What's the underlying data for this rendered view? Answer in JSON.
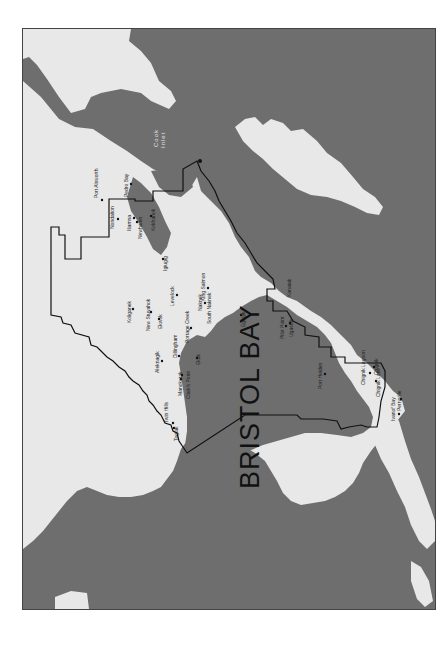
{
  "map": {
    "region_title": "BRISTOL BAY",
    "water_label_line1": "Cook",
    "water_label_line2": "Inlet",
    "orientation": "rotated 90° counter-clockwise",
    "colors": {
      "water": "#6e6e6e",
      "land": "#e8e8e8",
      "boundary": "#111111",
      "frame": "#444444"
    },
    "places": [
      {
        "name": "Port Alsworth"
      },
      {
        "name": "Nondalton"
      },
      {
        "name": "Pedro Bay"
      },
      {
        "name": "Iliamna"
      },
      {
        "name": "Newhalen"
      },
      {
        "name": "Kokhanok"
      },
      {
        "name": "Igiugig"
      },
      {
        "name": "Koliganek"
      },
      {
        "name": "New Stuyahok"
      },
      {
        "name": "Ekwok"
      },
      {
        "name": "Levelock"
      },
      {
        "name": "King Salmon"
      },
      {
        "name": "Naknek"
      },
      {
        "name": "South Naknek"
      },
      {
        "name": "Portage Creek"
      },
      {
        "name": "Dillingham"
      },
      {
        "name": "Aleknagik"
      },
      {
        "name": "Ekuk"
      },
      {
        "name": "Clark's Point"
      },
      {
        "name": "Manokotak"
      },
      {
        "name": "Twin Hills"
      },
      {
        "name": "Togiak"
      },
      {
        "name": "Egegik"
      },
      {
        "name": "Pilot Point"
      },
      {
        "name": "Ugashik"
      },
      {
        "name": "Kanatak"
      },
      {
        "name": "Port Heiden"
      },
      {
        "name": "Chignik Lagoon"
      },
      {
        "name": "Chignik"
      },
      {
        "name": "Chignik Lake"
      },
      {
        "name": "Ivanof Bay"
      },
      {
        "name": "Perryville"
      }
    ]
  }
}
